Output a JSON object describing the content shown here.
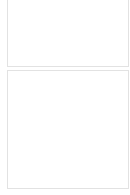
{
  "colors": {
    "empty_border": "#d4d4d4",
    "filled": "#000000",
    "panel_border": "#e2e2e2"
  },
  "top_panel": {
    "orientation": "rows",
    "rows": [
      {
        "count": 7,
        "filled": []
      },
      {
        "count": 9,
        "filled": [
          2
        ]
      },
      {
        "count": 10,
        "filled": [
          3
        ]
      },
      {
        "count": 12,
        "filled": [
          3
        ]
      }
    ]
  },
  "bottom_panel": {
    "orientation": "columns",
    "columns": [
      {
        "count": 13,
        "filled": [
          3
        ]
      },
      {
        "count": 10,
        "filled": [
          3
        ]
      },
      {
        "count": 9,
        "filled": [
          2
        ]
      },
      {
        "count": 7,
        "filled": []
      },
      {
        "count": 12,
        "filled": [
          1,
          11
        ]
      },
      {
        "count": 8,
        "filled": []
      },
      {
        "count": 10,
        "filled": [
          9
        ]
      }
    ]
  }
}
